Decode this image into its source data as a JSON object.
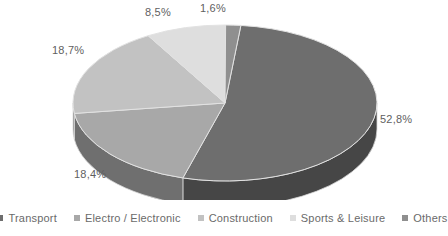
{
  "chart_data": {
    "type": "pie",
    "title": "",
    "three_d": true,
    "legend_position": "bottom",
    "categories": [
      "Transport",
      "Electro / Electronic",
      "Construction",
      "Sports & Leisure",
      "Others"
    ],
    "values": [
      52.8,
      18.4,
      18.7,
      8.5,
      1.6
    ],
    "value_labels": [
      "52,8%",
      "18,4%",
      "18,7%",
      "8,5%",
      "1,6%"
    ],
    "colors": [
      "#6e6e6e",
      "#a8a8a8",
      "#c2c2c2",
      "#dedede",
      "#8f8f8f"
    ],
    "side_colors": [
      "#464646",
      "#6f6f6f",
      "#7f7f7f",
      "#8f8f8f",
      "#5e5e5e"
    ],
    "slices": [
      {
        "label": "Transport",
        "value": 52.8,
        "display": "52,8%",
        "color": "#6e6e6e",
        "side_color": "#464646"
      },
      {
        "label": "Electro / Electronic",
        "value": 18.4,
        "display": "18,4%",
        "color": "#a8a8a8",
        "side_color": "#6f6f6f"
      },
      {
        "label": "Construction",
        "value": 18.7,
        "display": "18,7%",
        "color": "#c2c2c2",
        "side_color": "#7f7f7f"
      },
      {
        "label": "Sports & Leisure",
        "value": 8.5,
        "display": "8,5%",
        "color": "#dedede",
        "side_color": "#8f8f8f"
      },
      {
        "label": "Others",
        "value": 1.6,
        "display": "1,6%",
        "color": "#8f8f8f",
        "side_color": "#5e5e5e"
      }
    ]
  },
  "legend": {
    "items": [
      {
        "label": "Transport"
      },
      {
        "label": "Electro / Electronic"
      },
      {
        "label": "Construction"
      },
      {
        "label": "Sports & Leisure"
      },
      {
        "label": "Others"
      }
    ]
  },
  "labels": {
    "transport": "52,8%",
    "electro": "18,4%",
    "construction": "18,7%",
    "sports": "8,5%",
    "others": "1,6%"
  }
}
